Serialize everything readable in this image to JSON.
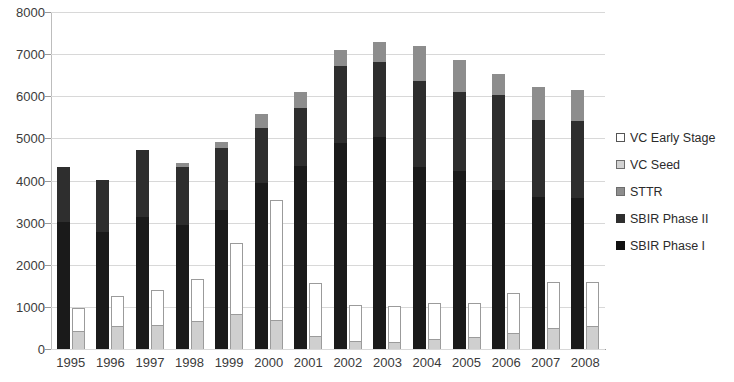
{
  "chart_data": {
    "type": "bar",
    "subtype": "grouped-stacked",
    "title": "",
    "xlabel": "",
    "ylabel": "",
    "ylim": [
      0,
      8000
    ],
    "ytick_step": 1000,
    "yticks": [
      "0",
      "1000",
      "2000",
      "3000",
      "4000",
      "5000",
      "6000",
      "7000",
      "8000"
    ],
    "grid": true,
    "legend_position": "right",
    "categories": [
      "1995",
      "1996",
      "1997",
      "1998",
      "1999",
      "2000",
      "2001",
      "2002",
      "2003",
      "2004",
      "2005",
      "2006",
      "2007",
      "2008"
    ],
    "series": [
      {
        "name": "SBIR Phase I",
        "group": "sbir",
        "values": [
          3020,
          2770,
          3140,
          2950,
          3300,
          3930,
          4350,
          4900,
          5030,
          4330,
          4220,
          3780,
          3600,
          3580
        ]
      },
      {
        "name": "SBIR Phase II",
        "group": "sbir",
        "values": [
          1300,
          1250,
          1580,
          1380,
          1480,
          1320,
          1380,
          1830,
          1780,
          2040,
          1870,
          2250,
          1840,
          1830
        ]
      },
      {
        "name": "STTR",
        "group": "sbir",
        "values": [
          0,
          0,
          0,
          80,
          130,
          320,
          380,
          370,
          490,
          830,
          770,
          500,
          790,
          750
        ]
      },
      {
        "name": "VC Seed",
        "group": "vc",
        "values": [
          430,
          540,
          560,
          670,
          820,
          700,
          320,
          200,
          170,
          230,
          280,
          390,
          510,
          550
        ]
      },
      {
        "name": "VC Early Stage",
        "group": "vc",
        "values": [
          550,
          710,
          830,
          1000,
          1690,
          2840,
          1250,
          840,
          850,
          870,
          810,
          950,
          1070,
          1040
        ]
      }
    ],
    "sbir_totals": [
      4320,
      4020,
      4720,
      4410,
      4910,
      5570,
      6110,
      7100,
      7300,
      7200,
      6860,
      6530,
      6230,
      6160
    ],
    "vc_totals": [
      980,
      1250,
      1390,
      1670,
      2510,
      3540,
      1570,
      1040,
      1020,
      1100,
      1090,
      1340,
      1580,
      1590
    ]
  },
  "legend": {
    "items": [
      {
        "label": "VC Early Stage",
        "swatch": "legend-swatch-white",
        "color": "#ffffff"
      },
      {
        "label": "VC Seed",
        "swatch": "legend-swatch-light-gray",
        "color": "#d2d2d2"
      },
      {
        "label": "STTR",
        "swatch": "legend-swatch-gray",
        "color": "#8d8d8d"
      },
      {
        "label": "SBIR Phase II",
        "swatch": "legend-swatch-dark",
        "color": "#2e2e2e"
      },
      {
        "label": "SBIR Phase I",
        "swatch": "legend-swatch-black",
        "color": "#111111"
      }
    ]
  }
}
